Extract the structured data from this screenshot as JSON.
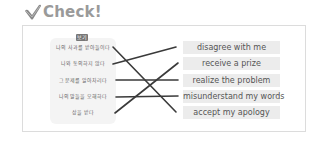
{
  "header": {
    "icon": "check-icon",
    "title": "Check!"
  },
  "exercise": {
    "badge": "보기",
    "left_items": [
      {
        "label": "나의 사과를 받아들이다"
      },
      {
        "label": "나와 동의하지 않다"
      },
      {
        "label": "그 문제를 알아차리다"
      },
      {
        "label": "나의 말들을 오해하다"
      },
      {
        "label": "상을 받다"
      }
    ],
    "right_items": [
      {
        "label": "disagree with me"
      },
      {
        "label": "receive a prize"
      },
      {
        "label": "realize the problem"
      },
      {
        "label": "misunderstand my words"
      },
      {
        "label": "accept my apology"
      }
    ],
    "matches": [
      {
        "left": 1,
        "right": 5
      },
      {
        "left": 2,
        "right": 1
      },
      {
        "left": 3,
        "right": 3
      },
      {
        "left": 4,
        "right": 4
      },
      {
        "left": 5,
        "right": 2
      }
    ],
    "line_color": "#3a3a3a"
  }
}
